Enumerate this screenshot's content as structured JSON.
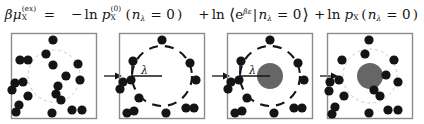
{
  "figure": {
    "equation": {
      "lhs": "βμX(ex)",
      "equals": "=",
      "term1": "−ln pX(0)(nλ = 0)",
      "term2": "+ ln ⟨e^{βε}|nλ = 0⟩",
      "term3": "+ ln pX(nλ = 0)",
      "symbols": {
        "beta": "β",
        "mu": "μ",
        "solute": "X",
        "ex": "(ex)",
        "zero_sup": "(0)",
        "p": "p",
        "ln": "ln",
        "e": "e",
        "epsilon": "ε",
        "n": "n",
        "lambda": "λ",
        "eq_zero": "= 0",
        "minus": "−",
        "plus": "+",
        "paren_open": "(",
        "paren_close": ")",
        "angle_open": "⟨",
        "angle_close": "⟩",
        "bar": "|"
      }
    },
    "panels": [
      {
        "id": "panel-1",
        "name": "bulk-solvent",
        "cavity_label": "",
        "cavity_style": "faint-dashed",
        "has_solute": false,
        "solute_radius": 0,
        "cavity_radius": 26,
        "particles": [
          [
            47,
            12
          ],
          [
            40,
            26
          ],
          [
            22,
            32
          ],
          [
            14,
            32
          ],
          [
            47,
            37
          ],
          [
            72,
            36
          ],
          [
            60,
            48
          ],
          [
            52,
            58
          ],
          [
            74,
            52
          ],
          [
            9,
            55
          ],
          [
            17,
            54
          ],
          [
            6,
            62
          ],
          [
            22,
            68
          ],
          [
            50,
            66
          ],
          [
            55,
            72
          ],
          [
            13,
            77
          ],
          [
            10,
            84
          ],
          [
            46,
            85
          ],
          [
            66,
            82
          ],
          [
            76,
            82
          ]
        ]
      },
      {
        "id": "panel-2",
        "name": "cavity-created",
        "cavity_label": "λ",
        "cavity_style": "bold-dashed",
        "has_solute": false,
        "solute_radius": 0,
        "cavity_radius": 30,
        "particles": [
          [
            48,
            12
          ],
          [
            19,
            33
          ],
          [
            76,
            35
          ],
          [
            9,
            54
          ],
          [
            17,
            52
          ],
          [
            82,
            52
          ],
          [
            6,
            61
          ],
          [
            25,
            70
          ],
          [
            20,
            83
          ],
          [
            13,
            85
          ],
          [
            52,
            85
          ],
          [
            72,
            80
          ],
          [
            80,
            80
          ]
        ]
      },
      {
        "id": "panel-3",
        "name": "solute-inserted",
        "cavity_label": "λ",
        "cavity_style": "bold-dashed",
        "has_solute": true,
        "solute_radius": 13,
        "cavity_radius": 30,
        "particles": [
          [
            48,
            12
          ],
          [
            19,
            33
          ],
          [
            76,
            35
          ],
          [
            9,
            54
          ],
          [
            17,
            52
          ],
          [
            82,
            52
          ],
          [
            6,
            61
          ],
          [
            25,
            70
          ],
          [
            20,
            83
          ],
          [
            13,
            85
          ],
          [
            52,
            85
          ],
          [
            72,
            80
          ],
          [
            80,
            80
          ]
        ]
      },
      {
        "id": "panel-4",
        "name": "solute-relaxed",
        "cavity_label": "",
        "cavity_style": "faint-dashed",
        "has_solute": true,
        "solute_radius": 13,
        "cavity_radius": 27,
        "particles": [
          [
            47,
            12
          ],
          [
            43,
            26
          ],
          [
            20,
            32
          ],
          [
            72,
            32
          ],
          [
            64,
            47
          ],
          [
            8,
            54
          ],
          [
            17,
            52
          ],
          [
            76,
            54
          ],
          [
            7,
            63
          ],
          [
            22,
            68
          ],
          [
            52,
            62
          ],
          [
            58,
            68
          ],
          [
            13,
            79
          ],
          [
            10,
            86
          ],
          [
            47,
            85
          ],
          [
            66,
            82
          ],
          [
            76,
            82
          ]
        ]
      }
    ],
    "arrows": [
      "→",
      "→",
      "→"
    ],
    "colors": {
      "particle": "#141414",
      "solute": "#666666",
      "box_border": "#8c8c8c",
      "cavity_faint": "#c9c9c9",
      "cavity_bold": "#141414",
      "background": "#ffffff",
      "text": "#141414"
    }
  }
}
